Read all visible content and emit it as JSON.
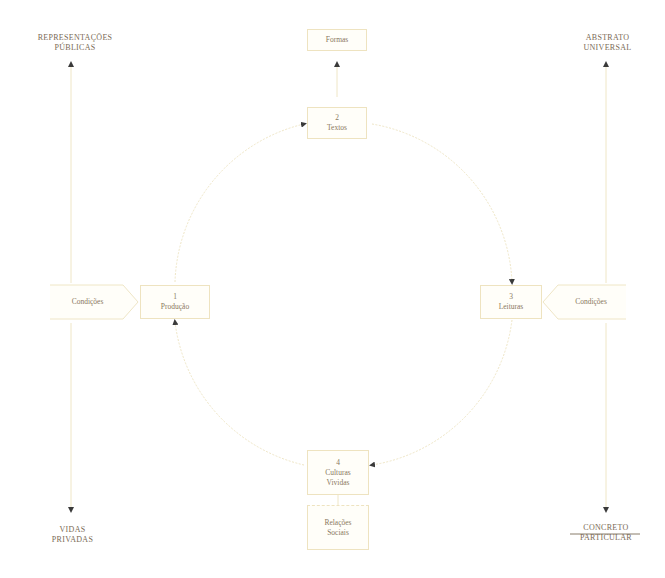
{
  "diagram": {
    "colors": {
      "line": "#efe6c6",
      "text": "#7a6a55",
      "arrow": "#3a3a3a"
    },
    "corners": {
      "top_left": [
        "REPRESENTAÇÕES",
        "PÚBLICAS"
      ],
      "top_right": [
        "ABSTRATO",
        "UNIVERSAL"
      ],
      "bottom_left": [
        "VIDAS",
        "PRIVADAS"
      ],
      "bottom_right": [
        "CONCRETO",
        "PARTICULAR"
      ]
    },
    "top_box": "Formas",
    "bottom_box": [
      "Relações",
      "Sociais"
    ],
    "left_condition": "Condições",
    "right_condition": "Condições",
    "nodes": [
      {
        "number": "1",
        "label": "Produção"
      },
      {
        "number": "2",
        "label": "Textos"
      },
      {
        "number": "3",
        "label": "Leituras"
      },
      {
        "number": "4",
        "label": "Culturas Vividas",
        "lines": [
          "Culturas",
          "Vividas"
        ]
      }
    ]
  }
}
